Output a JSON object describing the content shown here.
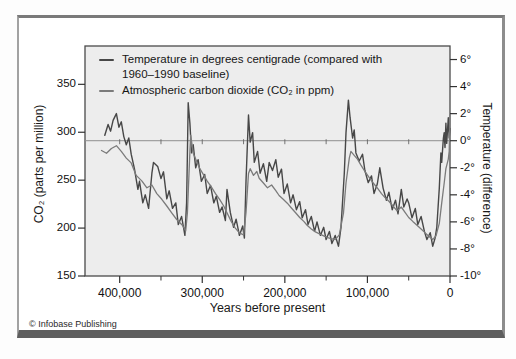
{
  "figure": {
    "credit": "© Infobase Publishing",
    "legend": [
      {
        "line1": "Temperature in degrees centigrade (compared with",
        "line2": "1960–1990 baseline)",
        "color": "#474747"
      },
      {
        "line1": "Atmospheric carbon dioxide (CO₂ in ppm)",
        "line2": "",
        "color": "#7b7b7b"
      }
    ]
  },
  "chart_data": {
    "type": "line",
    "xlabel": "Years before present",
    "plot_bg": "#ededed",
    "frame_color": "#4a4a4a",
    "x_axis": {
      "range_kyr": [
        442,
        0
      ],
      "ticks_kyr": [
        400,
        300,
        200,
        100,
        0
      ],
      "tick_labels": [
        "400,000",
        "300,000",
        "200,000",
        "100,000",
        "0"
      ],
      "minor_ticks_kyr": [
        350,
        250,
        150,
        50
      ]
    },
    "left_axis": {
      "label": "CO₂ (parts per million)",
      "ticks": [
        350,
        300,
        250,
        200,
        150
      ],
      "tick_labels": [
        "350",
        "300",
        "250",
        "200",
        "150"
      ],
      "range": [
        150,
        390
      ]
    },
    "right_axis": {
      "label": "Temperature (difference)",
      "ticks": [
        6,
        4,
        2,
        0,
        -2,
        -4,
        -6,
        -8,
        -10
      ],
      "tick_labels": [
        "6°",
        "4°",
        "2°",
        "0°",
        "-2°",
        "-4°",
        "-6°",
        "-8°",
        "-10°"
      ],
      "range": [
        -10,
        7
      ]
    },
    "reference_line": {
      "axis": "right",
      "value": 0,
      "color": "#8f8f8f",
      "tick_marks_kyr": [
        400,
        350,
        300,
        250,
        200,
        150,
        100,
        50
      ]
    },
    "series": [
      {
        "name": "Temperature in degrees centigrade (compared with 1960–1990 baseline)",
        "axis": "right",
        "unit": "°C difference",
        "color": "#474747",
        "width": 1.4,
        "points": [
          [
            418,
            0.4
          ],
          [
            414,
            1.2
          ],
          [
            411,
            0.7
          ],
          [
            408,
            1.5
          ],
          [
            404,
            2.0
          ],
          [
            401,
            1.0
          ],
          [
            398,
            1.4
          ],
          [
            395,
            0.3
          ],
          [
            392,
            -0.3
          ],
          [
            389,
            0.2
          ],
          [
            386,
            -1.0
          ],
          [
            382,
            -2.1
          ],
          [
            378,
            -3.6
          ],
          [
            376,
            -3.0
          ],
          [
            372,
            -4.6
          ],
          [
            369,
            -4.0
          ],
          [
            365,
            -5.0
          ],
          [
            361,
            -2.4
          ],
          [
            359,
            -1.6
          ],
          [
            354,
            -1.9
          ],
          [
            350,
            -2.8
          ],
          [
            347,
            -2.3
          ],
          [
            343,
            -4.3
          ],
          [
            340,
            -3.7
          ],
          [
            336,
            -5.0
          ],
          [
            332,
            -4.6
          ],
          [
            329,
            -6.2
          ],
          [
            325,
            -5.6
          ],
          [
            321,
            -7.0
          ],
          [
            319,
            -4.6
          ],
          [
            318,
            -1.0
          ],
          [
            317,
            2.8
          ],
          [
            315,
            1.3
          ],
          [
            313,
            -0.9
          ],
          [
            311,
            -0.3
          ],
          [
            308,
            -2.0
          ],
          [
            305,
            -1.4
          ],
          [
            301,
            -3.0
          ],
          [
            297,
            -2.5
          ],
          [
            294,
            -3.9
          ],
          [
            290,
            -3.3
          ],
          [
            286,
            -4.6
          ],
          [
            283,
            -4.1
          ],
          [
            279,
            -5.3
          ],
          [
            276,
            -4.9
          ],
          [
            272,
            -5.9
          ],
          [
            270,
            -3.6
          ],
          [
            266,
            -5.3
          ],
          [
            262,
            -6.4
          ],
          [
            259,
            -5.8
          ],
          [
            255,
            -7.0
          ],
          [
            251,
            -6.3
          ],
          [
            249,
            -7.2
          ],
          [
            247,
            -3.0
          ],
          [
            244,
            1.9
          ],
          [
            242,
            -0.1
          ],
          [
            239,
            0.6
          ],
          [
            237,
            -1.6
          ],
          [
            233,
            -0.8
          ],
          [
            230,
            -2.4
          ],
          [
            226,
            -1.7
          ],
          [
            222,
            -3.0
          ],
          [
            219,
            -1.6
          ],
          [
            215,
            -2.2
          ],
          [
            211,
            -1.4
          ],
          [
            208,
            -2.7
          ],
          [
            204,
            -2.1
          ],
          [
            201,
            -3.9
          ],
          [
            197,
            -3.2
          ],
          [
            193,
            -4.6
          ],
          [
            190,
            -4.0
          ],
          [
            186,
            -5.1
          ],
          [
            182,
            -4.5
          ],
          [
            179,
            -5.7
          ],
          [
            175,
            -5.1
          ],
          [
            172,
            -6.2
          ],
          [
            168,
            -5.6
          ],
          [
            164,
            -6.7
          ],
          [
            161,
            -6.0
          ],
          [
            157,
            -7.0
          ],
          [
            153,
            -6.4
          ],
          [
            150,
            -7.3
          ],
          [
            146,
            -6.7
          ],
          [
            143,
            -7.6
          ],
          [
            139,
            -7.0
          ],
          [
            135,
            -7.8
          ],
          [
            132,
            -6.4
          ],
          [
            128,
            -2.4
          ],
          [
            126,
            0.6
          ],
          [
            123,
            3.0
          ],
          [
            121,
            1.7
          ],
          [
            118,
            0.2
          ],
          [
            116,
            0.8
          ],
          [
            114,
            -0.9
          ],
          [
            110,
            -1.5
          ],
          [
            106,
            -1.0
          ],
          [
            103,
            -2.2
          ],
          [
            99,
            -3.1
          ],
          [
            95,
            -2.6
          ],
          [
            92,
            -3.9
          ],
          [
            88,
            -3.2
          ],
          [
            85,
            -2.0
          ],
          [
            81,
            -3.5
          ],
          [
            77,
            -4.4
          ],
          [
            74,
            -3.8
          ],
          [
            70,
            -5.1
          ],
          [
            66,
            -4.4
          ],
          [
            63,
            -5.4
          ],
          [
            59,
            -3.6
          ],
          [
            56,
            -4.9
          ],
          [
            52,
            -4.3
          ],
          [
            50,
            -4.6
          ],
          [
            46,
            -5.7
          ],
          [
            42,
            -5.0
          ],
          [
            39,
            -6.2
          ],
          [
            35,
            -5.6
          ],
          [
            31,
            -6.7
          ],
          [
            28,
            -7.3
          ],
          [
            24,
            -6.8
          ],
          [
            21,
            -7.8
          ],
          [
            18,
            -7.2
          ],
          [
            16,
            -6.4
          ],
          [
            13,
            -3.5
          ],
          [
            11,
            -0.9
          ],
          [
            10,
            -1.6
          ],
          [
            8,
            0.2
          ],
          [
            7,
            0.6
          ],
          [
            6,
            -0.5
          ],
          [
            5,
            1.3
          ],
          [
            4,
            -0.2
          ],
          [
            2,
            1.7
          ],
          [
            1,
            0.2
          ],
          [
            0,
            0.9
          ]
        ]
      },
      {
        "name": "Atmospheric carbon dioxide (CO₂ in ppm)",
        "axis": "left",
        "unit": "ppm",
        "color": "#7b7b7b",
        "width": 1.3,
        "points": [
          [
            422,
            281
          ],
          [
            416,
            278
          ],
          [
            410,
            283
          ],
          [
            404,
            286
          ],
          [
            398,
            280
          ],
          [
            392,
            273
          ],
          [
            386,
            268
          ],
          [
            380,
            255
          ],
          [
            373,
            249
          ],
          [
            367,
            242
          ],
          [
            361,
            245
          ],
          [
            355,
            236
          ],
          [
            349,
            230
          ],
          [
            343,
            223
          ],
          [
            337,
            216
          ],
          [
            331,
            209
          ],
          [
            324,
            203
          ],
          [
            320,
            197
          ],
          [
            318,
            216
          ],
          [
            315,
            280
          ],
          [
            314,
            297
          ],
          [
            311,
            278
          ],
          [
            307,
            270
          ],
          [
            303,
            262
          ],
          [
            298,
            255
          ],
          [
            294,
            249
          ],
          [
            289,
            243
          ],
          [
            284,
            236
          ],
          [
            279,
            230
          ],
          [
            274,
            223
          ],
          [
            270,
            216
          ],
          [
            265,
            207
          ],
          [
            260,
            200
          ],
          [
            255,
            195
          ],
          [
            250,
            193
          ],
          [
            247,
            216
          ],
          [
            244,
            257
          ],
          [
            242,
            262
          ],
          [
            238,
            255
          ],
          [
            234,
            259
          ],
          [
            231,
            252
          ],
          [
            226,
            247
          ],
          [
            221,
            242
          ],
          [
            216,
            245
          ],
          [
            211,
            239
          ],
          [
            207,
            234
          ],
          [
            202,
            230
          ],
          [
            197,
            226
          ],
          [
            192,
            221
          ],
          [
            187,
            216
          ],
          [
            182,
            211
          ],
          [
            177,
            207
          ],
          [
            173,
            203
          ],
          [
            168,
            199
          ],
          [
            163,
            196
          ],
          [
            158,
            194
          ],
          [
            153,
            192
          ],
          [
            148,
            190
          ],
          [
            144,
            189
          ],
          [
            139,
            188
          ],
          [
            134,
            193
          ],
          [
            129,
            216
          ],
          [
            126,
            247
          ],
          [
            122,
            273
          ],
          [
            120,
            280
          ],
          [
            116,
            276
          ],
          [
            112,
            272
          ],
          [
            108,
            266
          ],
          [
            103,
            259
          ],
          [
            98,
            253
          ],
          [
            93,
            247
          ],
          [
            88,
            242
          ],
          [
            83,
            236
          ],
          [
            79,
            232
          ],
          [
            74,
            228
          ],
          [
            69,
            223
          ],
          [
            64,
            218
          ],
          [
            59,
            222
          ],
          [
            54,
            216
          ],
          [
            50,
            211
          ],
          [
            45,
            207
          ],
          [
            40,
            203
          ],
          [
            35,
            199
          ],
          [
            30,
            195
          ],
          [
            25,
            191
          ],
          [
            21,
            188
          ],
          [
            17,
            192
          ],
          [
            13,
            205
          ],
          [
            10,
            226
          ],
          [
            7,
            247
          ],
          [
            5,
            262
          ],
          [
            2,
            272
          ],
          [
            1,
            280
          ],
          [
            0,
            318
          ]
        ]
      }
    ]
  }
}
